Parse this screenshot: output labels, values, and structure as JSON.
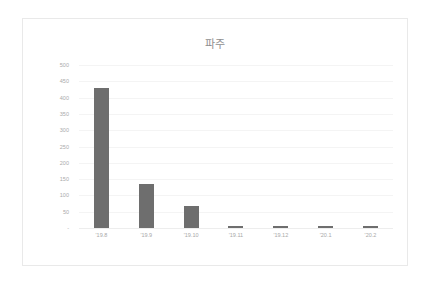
{
  "chart_data": {
    "type": "bar",
    "title": "파주",
    "xlabel": "",
    "ylabel": "",
    "categories": [
      "'19.8",
      "'19.9",
      "'19.10",
      "'19.11",
      "'19.12",
      "'20.1",
      "'20.2"
    ],
    "values": [
      430,
      135,
      68,
      7,
      7,
      6,
      6
    ],
    "ylim": [
      0,
      500
    ],
    "ytick_values": [
      500,
      450,
      400,
      350,
      300,
      250,
      200,
      150,
      100,
      50,
      0
    ],
    "ytick_labels": [
      "500",
      "450",
      "400",
      "350",
      "300",
      "250",
      "200",
      "150",
      "100",
      "50",
      "-"
    ],
    "grid": true,
    "legend": false,
    "series": [
      {
        "name": "파주",
        "values": [
          430,
          135,
          68,
          7,
          7,
          6,
          6
        ]
      }
    ]
  },
  "style": {
    "bar_color": "#6e6e6e",
    "grid_color": "#f4f4f4",
    "axis_text_color": "#a8a8a8",
    "title_color": "#8f8f8f",
    "frame_border_color": "#e9e9e9",
    "background": "#ffffff"
  }
}
